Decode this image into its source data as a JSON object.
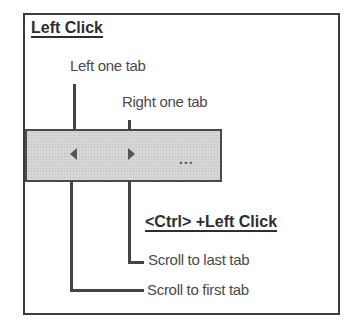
{
  "diagram": {
    "left_click_section": {
      "heading": "Left Click",
      "left_arrow_label": "Left one tab",
      "right_arrow_label": "Right one tab"
    },
    "ctrl_click_section": {
      "heading": "<Ctrl> +Left Click",
      "right_arrow_label": "Scroll to last tab",
      "left_arrow_label": "Scroll to first tab"
    },
    "tab_scroller": {
      "left_arrow_icon": "triangle-left-icon",
      "right_arrow_icon": "triangle-right-icon",
      "overflow_label": "..."
    },
    "colors": {
      "frame": "#3c3c3c",
      "tabbar_fill": "#d6d6d6",
      "line": "#444444",
      "text": "#4a4a4a"
    }
  }
}
